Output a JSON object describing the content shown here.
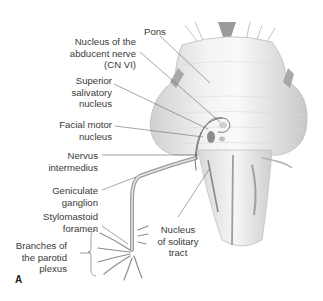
{
  "figure": {
    "panel_letter": "A",
    "labels": {
      "pons": "Pons",
      "abducent": "Nucleus of the\nabducent nerve\n(CN VI)",
      "superior_salivatory": "Superior\nsalivatory\nnucleus",
      "facial_motor": "Facial motor\nnucleus",
      "nervus_intermedius": "Nervus\nintermedius",
      "geniculate": "Geniculate\nganglion",
      "stylomastoid": "Stylomastoid\nforamen",
      "parotid": "Branches of\nthe parotid\nplexus",
      "solitary": "Nucleus\nof solitary\ntract"
    },
    "colors": {
      "label_text": "#3a3a3a",
      "leader_line": "#6a6a6a",
      "nerve": "#9a9a9a",
      "brainstem_fill": "#ececec",
      "nucleus_fill": "#8c8c8c"
    }
  }
}
